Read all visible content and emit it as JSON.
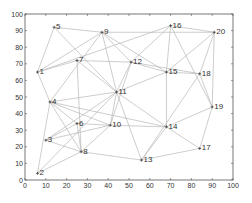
{
  "chart_data": {
    "type": "scatter",
    "title": "",
    "xlabel": "",
    "ylabel": "",
    "xlim": [
      0,
      100
    ],
    "ylim": [
      0,
      100
    ],
    "grid": false,
    "legend": null,
    "x_ticks": [
      0,
      10,
      20,
      30,
      40,
      50,
      60,
      70,
      80,
      90,
      100
    ],
    "y_ticks": [
      0,
      10,
      20,
      30,
      40,
      50,
      60,
      70,
      80,
      90,
      100
    ],
    "nodes": [
      {
        "id": 1,
        "label": "1",
        "x": 6,
        "y": 65
      },
      {
        "id": 2,
        "label": "2",
        "x": 6,
        "y": 4
      },
      {
        "id": 3,
        "label": "3",
        "x": 10,
        "y": 24
      },
      {
        "id": 4,
        "label": "4",
        "x": 12,
        "y": 47
      },
      {
        "id": 5,
        "label": "5",
        "x": 14,
        "y": 92
      },
      {
        "id": 6,
        "label": "6",
        "x": 25,
        "y": 34
      },
      {
        "id": 7,
        "label": "7",
        "x": 25,
        "y": 72
      },
      {
        "id": 8,
        "label": "8",
        "x": 27,
        "y": 17
      },
      {
        "id": 9,
        "label": "9",
        "x": 37,
        "y": 89
      },
      {
        "id": 10,
        "label": "10",
        "x": 41,
        "y": 33
      },
      {
        "id": 11,
        "label": "11",
        "x": 44,
        "y": 53
      },
      {
        "id": 12,
        "label": "12",
        "x": 51,
        "y": 71
      },
      {
        "id": 13,
        "label": "13",
        "x": 56,
        "y": 12
      },
      {
        "id": 14,
        "label": "14",
        "x": 68,
        "y": 32
      },
      {
        "id": 15,
        "label": "15",
        "x": 68,
        "y": 65
      },
      {
        "id": 16,
        "label": "16",
        "x": 70,
        "y": 93
      },
      {
        "id": 17,
        "label": "17",
        "x": 84,
        "y": 19
      },
      {
        "id": 18,
        "label": "18",
        "x": 84,
        "y": 64
      },
      {
        "id": 19,
        "label": "19",
        "x": 90,
        "y": 44
      },
      {
        "id": 20,
        "label": "20",
        "x": 91,
        "y": 89
      }
    ],
    "edges": [
      [
        1,
        5
      ],
      [
        1,
        7
      ],
      [
        1,
        9
      ],
      [
        1,
        4
      ],
      [
        5,
        9
      ],
      [
        5,
        11
      ],
      [
        9,
        20
      ],
      [
        9,
        15
      ],
      [
        9,
        12
      ],
      [
        9,
        11
      ],
      [
        9,
        4
      ],
      [
        7,
        12
      ],
      [
        7,
        11
      ],
      [
        7,
        8
      ],
      [
        16,
        12
      ],
      [
        16,
        15
      ],
      [
        16,
        19
      ],
      [
        16,
        20
      ],
      [
        16,
        1
      ],
      [
        20,
        15
      ],
      [
        20,
        19
      ],
      [
        20,
        18
      ],
      [
        12,
        15
      ],
      [
        12,
        18
      ],
      [
        12,
        10
      ],
      [
        12,
        11
      ],
      [
        15,
        18
      ],
      [
        15,
        14
      ],
      [
        15,
        11
      ],
      [
        18,
        19
      ],
      [
        18,
        13
      ],
      [
        4,
        11
      ],
      [
        4,
        10
      ],
      [
        4,
        6
      ],
      [
        4,
        8
      ],
      [
        4,
        2
      ],
      [
        4,
        14
      ],
      [
        3,
        6
      ],
      [
        3,
        10
      ],
      [
        3,
        8
      ],
      [
        3,
        11
      ],
      [
        6,
        10
      ],
      [
        6,
        8
      ],
      [
        2,
        8
      ],
      [
        2,
        11
      ],
      [
        8,
        13
      ],
      [
        8,
        10
      ],
      [
        10,
        14
      ],
      [
        10,
        11
      ],
      [
        11,
        14
      ],
      [
        11,
        13
      ],
      [
        14,
        19
      ],
      [
        14,
        17
      ],
      [
        14,
        13
      ],
      [
        13,
        17
      ],
      [
        17,
        19
      ]
    ]
  },
  "colors": {
    "edge": "#b8b8b8",
    "axis": "#555555",
    "text": "#333333",
    "background": "#ffffff"
  }
}
